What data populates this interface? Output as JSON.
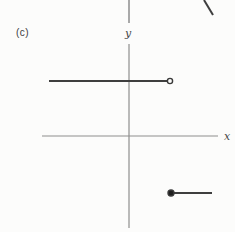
{
  "page": {
    "background": "#fcfcfb"
  },
  "figure": {
    "panel_label": "(c)",
    "x_axis_label": "x",
    "y_axis_label": "y"
  },
  "colors": {
    "axis": "#8e8e8e",
    "curve": "#3e3e3e",
    "point_fill": "#1f1f1f",
    "open_point_fill": "#fcfcfb",
    "point_stroke": "#3a3a3a"
  },
  "chart_data": {
    "type": "line",
    "title": "",
    "xlabel": "x",
    "ylabel": "y",
    "grid": false,
    "legend": "none",
    "origin_px": {
      "x": 129,
      "y": 136
    },
    "axes_px": {
      "x_axis": {
        "x1": 42,
        "y1": 136,
        "x2": 218,
        "y2": 136,
        "width": 1.2
      },
      "y_axis": {
        "x1": 129,
        "y1": 44,
        "x2": 129,
        "y2": 228,
        "width": 1.2
      }
    },
    "segments_px": [
      {
        "name": "upper-branch",
        "x1": 49,
        "y1": 81,
        "x2": 167,
        "y2": 81,
        "width": 1.8
      },
      {
        "name": "lower-branch",
        "x1": 172,
        "y1": 193,
        "x2": 212,
        "y2": 193,
        "width": 1.8
      }
    ],
    "endpoints_px": [
      {
        "name": "open-endpoint",
        "cx": 170,
        "cy": 81,
        "r": 2.6,
        "style": "open"
      },
      {
        "name": "closed-endpoint",
        "cx": 171,
        "cy": 193,
        "r": 3.0,
        "style": "closed"
      }
    ],
    "artifacts_px": [
      {
        "name": "previous-figure-y-axis",
        "x1": 129,
        "y1": 0,
        "x2": 129,
        "y2": 23,
        "stroke": "axis",
        "width": 1.5
      },
      {
        "name": "previous-figure-curve",
        "x1": 204,
        "y1": 0,
        "x2": 213,
        "y2": 15,
        "stroke": "curve",
        "width": 2.0
      }
    ]
  }
}
